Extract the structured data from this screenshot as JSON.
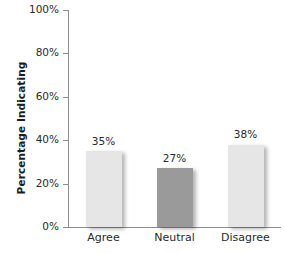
{
  "chart_data": {
    "type": "bar",
    "title": "",
    "subtitle": "",
    "categories": [
      "Agree",
      "Neutral",
      "Disagree"
    ],
    "values": [
      35,
      27,
      38
    ],
    "value_labels": [
      "35%",
      "27%",
      "38%"
    ],
    "xlabel": "",
    "ylabel": "Percentage Indicating",
    "ylim": [
      0,
      100
    ],
    "yticks": [
      0,
      20,
      40,
      60,
      80,
      100
    ],
    "ytick_labels": [
      "0%",
      "20%",
      "40%",
      "60%",
      "80%",
      "100%"
    ],
    "grid": false,
    "legend": false,
    "legend_position": "none",
    "bar_colors": [
      "#e6e6e6",
      "#9a9a9a",
      "#e6e6e6"
    ],
    "axis_color": "#8d8d8d",
    "background": "#ffffff",
    "text_color": "#2a2a2a"
  }
}
